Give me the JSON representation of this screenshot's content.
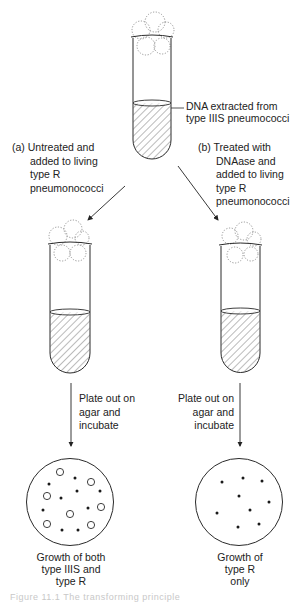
{
  "figure": {
    "source_tube": {
      "label_lines": [
        "DNA extracted from",
        "type IIIS pneumococci"
      ]
    },
    "branches": [
      {
        "id": "a",
        "label_lines": [
          "(a) Untreated and",
          "added to living",
          "type R",
          "pneumonococci"
        ],
        "step_lines": [
          "Plate out on",
          "agar and",
          "incubate"
        ],
        "result_lines": [
          "Growth of both",
          "type IIIS and",
          "type R"
        ],
        "colonies": {
          "large_open": 7,
          "small_dots": 9
        }
      },
      {
        "id": "b",
        "label_lines": [
          "(b) Treated with",
          "DNAase and",
          "added to living",
          "type R",
          "pneumonococci"
        ],
        "step_lines": [
          "Plate out on",
          "agar and",
          "incubate"
        ],
        "result_lines": [
          "Growth of",
          "type R",
          "only"
        ],
        "colonies": {
          "large_open": 0,
          "small_dots": 9
        }
      }
    ],
    "caption": "Figure 11.1   The transforming principle"
  },
  "colors": {
    "ink": "#2a2a2a",
    "cloud": "#8a8a8a",
    "caption": "#c8c8c8"
  }
}
